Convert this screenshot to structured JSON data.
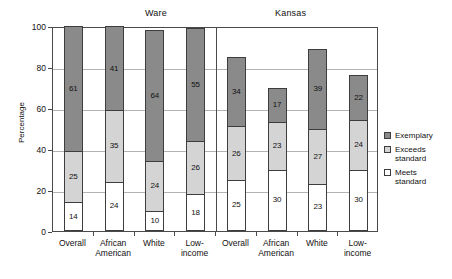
{
  "chart_data": {
    "type": "bar",
    "title": "",
    "subtitle": "",
    "xlabel": "",
    "ylabel": "Percentage",
    "ylim": [
      0,
      100
    ],
    "yticks": [
      0,
      20,
      40,
      60,
      80,
      100
    ],
    "grid": true,
    "stacked": true,
    "legend_position": "right",
    "panels": [
      {
        "name": "Ware",
        "categories": [
          "Overall",
          "African American",
          "White",
          "Low-income"
        ],
        "series": [
          {
            "name": "Meets standard",
            "values": [
              14,
              24,
              10,
              18
            ]
          },
          {
            "name": "Exceeds standard",
            "values": [
              25,
              35,
              24,
              26
            ]
          },
          {
            "name": "Exemplary",
            "values": [
              61,
              41,
              64,
              55
            ]
          }
        ],
        "totals": [
          100,
          100,
          98,
          99
        ]
      },
      {
        "name": "Kansas",
        "categories": [
          "Overall",
          "African American",
          "White",
          "Low-income"
        ],
        "series": [
          {
            "name": "Meets standard",
            "values": [
              25,
              30,
              23,
              30
            ]
          },
          {
            "name": "Exceeds standard",
            "values": [
              26,
              23,
              27,
              24
            ]
          },
          {
            "name": "Exemplary",
            "values": [
              34,
              17,
              39,
              22
            ]
          }
        ],
        "totals": [
          85,
          70,
          89,
          76
        ]
      }
    ],
    "legend": [
      {
        "label": "Exemplary",
        "color": "#8a8a8a"
      },
      {
        "label": "Exceeds\nstandard",
        "color": "#d4d4d4"
      },
      {
        "label": "Meets\nstandard",
        "color": "#ffffff"
      }
    ],
    "colors": {
      "exemplary": "#8a8a8a",
      "exceeds": "#d4d4d4",
      "meets": "#ffffff",
      "axis": "#4a4a4a",
      "grid": "#b3b3b3",
      "text": "#111111",
      "background": "#ffffff"
    }
  }
}
